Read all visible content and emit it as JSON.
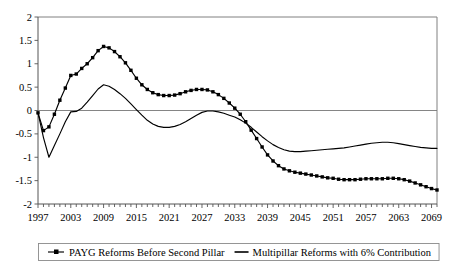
{
  "chart_data": {
    "type": "line",
    "title": "",
    "subtitle": "",
    "xlabel": "",
    "ylabel": "",
    "xlim": [
      1997,
      2070
    ],
    "ylim": [
      -2,
      2
    ],
    "grid": false,
    "legend_position": "bottom",
    "y_ticks": [
      "2",
      "1.5",
      "1",
      "0.5",
      "0",
      "-0.5",
      "-1",
      "-1.5",
      "-2"
    ],
    "y_tick_values": [
      2,
      1.5,
      1,
      0.5,
      0,
      -0.5,
      -1,
      -1.5,
      -2
    ],
    "x_ticks": [
      "1997",
      "2003",
      "2009",
      "2015",
      "2021",
      "2027",
      "2033",
      "2039",
      "2045",
      "2051",
      "2057",
      "2063",
      "2069"
    ],
    "x_tick_values": [
      1997,
      2003,
      2009,
      2015,
      2021,
      2027,
      2033,
      2039,
      2045,
      2051,
      2057,
      2063,
      2069
    ],
    "x_minor_step": 1,
    "zero_line": 0,
    "series": [
      {
        "name": "PAYG Reforms Before Second Pillar",
        "marker": "square",
        "color": "#000000",
        "x": [
          1997,
          1998,
          1999,
          2000,
          2001,
          2002,
          2003,
          2004,
          2005,
          2006,
          2007,
          2008,
          2009,
          2010,
          2011,
          2012,
          2013,
          2014,
          2015,
          2016,
          2017,
          2018,
          2019,
          2020,
          2021,
          2022,
          2023,
          2024,
          2025,
          2026,
          2027,
          2028,
          2029,
          2030,
          2031,
          2032,
          2033,
          2034,
          2035,
          2036,
          2037,
          2038,
          2039,
          2040,
          2041,
          2042,
          2043,
          2044,
          2045,
          2046,
          2047,
          2048,
          2049,
          2050,
          2051,
          2052,
          2053,
          2054,
          2055,
          2056,
          2057,
          2058,
          2059,
          2060,
          2061,
          2062,
          2063,
          2064,
          2065,
          2066,
          2067,
          2068,
          2069,
          2070
        ],
        "y": [
          -0.05,
          -0.43,
          -0.35,
          -0.08,
          0.22,
          0.48,
          0.75,
          0.78,
          0.9,
          1.0,
          1.13,
          1.28,
          1.37,
          1.34,
          1.26,
          1.15,
          1.02,
          0.86,
          0.69,
          0.55,
          0.45,
          0.38,
          0.34,
          0.32,
          0.32,
          0.33,
          0.36,
          0.4,
          0.43,
          0.45,
          0.45,
          0.44,
          0.4,
          0.34,
          0.26,
          0.16,
          0.05,
          -0.08,
          -0.24,
          -0.42,
          -0.6,
          -0.78,
          -0.95,
          -1.08,
          -1.18,
          -1.25,
          -1.29,
          -1.32,
          -1.34,
          -1.36,
          -1.38,
          -1.4,
          -1.42,
          -1.44,
          -1.45,
          -1.47,
          -1.48,
          -1.48,
          -1.48,
          -1.47,
          -1.46,
          -1.46,
          -1.46,
          -1.46,
          -1.45,
          -1.45,
          -1.46,
          -1.48,
          -1.51,
          -1.55,
          -1.59,
          -1.63,
          -1.67,
          -1.7
        ]
      },
      {
        "name": "Multipillar Reforms with 6% Contribution",
        "marker": "none",
        "color": "#000000",
        "x": [
          1997,
          1998,
          1999,
          2000,
          2001,
          2002,
          2003,
          2004,
          2005,
          2006,
          2007,
          2008,
          2009,
          2010,
          2011,
          2012,
          2013,
          2014,
          2015,
          2016,
          2017,
          2018,
          2019,
          2020,
          2021,
          2022,
          2023,
          2024,
          2025,
          2026,
          2027,
          2028,
          2029,
          2030,
          2031,
          2032,
          2033,
          2034,
          2035,
          2036,
          2037,
          2038,
          2039,
          2040,
          2041,
          2042,
          2043,
          2044,
          2045,
          2046,
          2047,
          2048,
          2049,
          2050,
          2051,
          2052,
          2053,
          2054,
          2055,
          2056,
          2057,
          2058,
          2059,
          2060,
          2061,
          2062,
          2063,
          2064,
          2065,
          2066,
          2067,
          2068,
          2069,
          2070
        ],
        "y": [
          -0.05,
          -0.58,
          -1.0,
          -0.75,
          -0.5,
          -0.24,
          -0.03,
          -0.02,
          0.05,
          0.18,
          0.32,
          0.46,
          0.55,
          0.52,
          0.45,
          0.36,
          0.26,
          0.14,
          0.02,
          -0.1,
          -0.21,
          -0.29,
          -0.34,
          -0.36,
          -0.36,
          -0.34,
          -0.3,
          -0.24,
          -0.17,
          -0.1,
          -0.04,
          -0.01,
          -0.01,
          -0.03,
          -0.06,
          -0.1,
          -0.14,
          -0.2,
          -0.27,
          -0.36,
          -0.46,
          -0.56,
          -0.65,
          -0.73,
          -0.79,
          -0.84,
          -0.87,
          -0.88,
          -0.88,
          -0.87,
          -0.86,
          -0.85,
          -0.84,
          -0.83,
          -0.82,
          -0.81,
          -0.8,
          -0.78,
          -0.76,
          -0.74,
          -0.72,
          -0.7,
          -0.69,
          -0.68,
          -0.68,
          -0.69,
          -0.71,
          -0.73,
          -0.75,
          -0.77,
          -0.79,
          -0.8,
          -0.81,
          -0.81
        ]
      }
    ]
  },
  "legend": {
    "items": [
      {
        "label": "PAYG Reforms Before Second Pillar",
        "marker": "square-line"
      },
      {
        "label": "Multipillar Reforms with 6% Contribution",
        "marker": "plain-line"
      }
    ]
  }
}
